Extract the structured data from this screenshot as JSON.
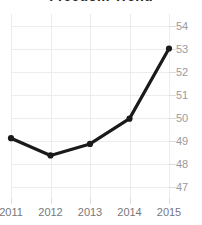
{
  "chart_data": {
    "type": "line",
    "title": "Freedom Trend",
    "xlabel": "",
    "ylabel": "",
    "categories": [
      "2011",
      "2012",
      "2013",
      "2014",
      "2015"
    ],
    "x": [
      2011,
      2012,
      2013,
      2014,
      2015
    ],
    "values": [
      49.1,
      48.35,
      48.85,
      49.95,
      53.0
    ],
    "series": [
      {
        "name": "Freedom Trend",
        "values": [
          49.1,
          48.35,
          48.85,
          49.95,
          53.0
        ]
      }
    ],
    "ylim": [
      46.5,
      54.5
    ],
    "xlim": [
      2011,
      2015
    ],
    "yticks": [
      54,
      53,
      52,
      51,
      50,
      49,
      48,
      47
    ],
    "ytick_labels": [
      "54",
      "53",
      "52",
      "51",
      "50",
      "49",
      "48",
      "47"
    ],
    "xticks": [
      2011,
      2012,
      2013,
      2014,
      2015
    ],
    "xtick_labels": [
      "2011",
      "2012",
      "2013",
      "2014",
      "2015"
    ],
    "grid": true,
    "legend": false,
    "legend_position": "none",
    "y_axis_position": "right",
    "marker": "circle",
    "colors": {
      "line": "#1a1a1a",
      "marker": "#1a1a1a",
      "grid": "#ececed",
      "ytick_text": "#9a9a9e",
      "xtick_text": "#77777b",
      "title_text": "#262626",
      "background": "#ffffff"
    }
  }
}
